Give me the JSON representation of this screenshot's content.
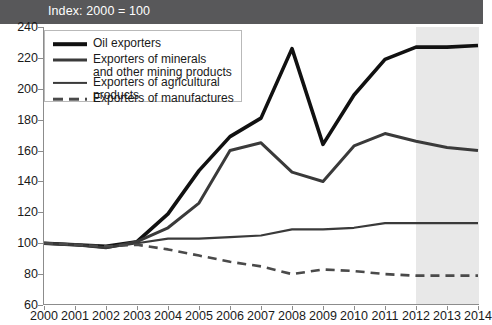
{
  "header": {
    "title": "Index: 2000 = 100",
    "bar_color": "#58585a",
    "text_color": "#ffffff"
  },
  "legend": {
    "items": [
      {
        "label": "Oil exporters",
        "color": "#111111",
        "width": 3.6,
        "dashed": false
      },
      {
        "label": "Exporters of minerals\nand other mining products",
        "color": "#3a3a3a",
        "width": 3.0,
        "dashed": false
      },
      {
        "label": "Exporters of agricultural products",
        "color": "#3a3a3a",
        "width": 2.2,
        "dashed": false
      },
      {
        "label": "Exporters of manufactures",
        "color": "#4a4a4a",
        "width": 2.6,
        "dashed": true
      }
    ]
  },
  "axes": {
    "y_ticks": [
      240,
      220,
      200,
      180,
      160,
      140,
      120,
      100,
      80,
      60
    ],
    "x_ticks": [
      "2000",
      "2001",
      "2002",
      "2003",
      "2004",
      "2005",
      "2006",
      "2007",
      "2008",
      "2009",
      "2010",
      "2011",
      "2012",
      "2013",
      "2014"
    ],
    "axis_color": "#8c8c8c",
    "label_color": "#1a1a1a"
  },
  "forecast": {
    "start_year": "2012",
    "end_year": "2014",
    "shade_color": "#e8e8e8"
  },
  "chart_data": {
    "type": "line",
    "title": "Index: 2000 = 100",
    "xlabel": "",
    "ylabel": "",
    "ylim": [
      60,
      240
    ],
    "xlim": [
      "2000",
      "2014"
    ],
    "grid": false,
    "legend_position": "top-left",
    "x": [
      2000,
      2001,
      2002,
      2003,
      2004,
      2005,
      2006,
      2007,
      2008,
      2009,
      2010,
      2011,
      2012,
      2013,
      2014
    ],
    "categories": [
      "2000",
      "2001",
      "2002",
      "2003",
      "2004",
      "2005",
      "2006",
      "2007",
      "2008",
      "2009",
      "2010",
      "2011",
      "2012",
      "2013",
      "2014"
    ],
    "annotations": [
      {
        "text": "shaded area 2012-2014 denotes projections",
        "x_start": 2012,
        "x_end": 2014
      }
    ],
    "series": [
      {
        "name": "Oil exporters",
        "color": "#111111",
        "width": 3.6,
        "dashed": false,
        "values": [
          100,
          99,
          98,
          101,
          119,
          147,
          169,
          181,
          226,
          164,
          196,
          219,
          227,
          227,
          228
        ]
      },
      {
        "name": "Exporters of minerals and other mining products",
        "color": "#3a3a3a",
        "width": 3.0,
        "dashed": false,
        "values": [
          100,
          99,
          97,
          101,
          110,
          126,
          160,
          165,
          146,
          140,
          163,
          171,
          166,
          162,
          160
        ]
      },
      {
        "name": "Exporters of agricultural products",
        "color": "#3a3a3a",
        "width": 2.2,
        "dashed": false,
        "values": [
          100,
          99,
          97,
          100,
          103,
          103,
          104,
          105,
          109,
          109,
          110,
          113,
          113,
          113,
          113
        ]
      },
      {
        "name": "Exporters of manufactures",
        "color": "#4a4a4a",
        "width": 2.6,
        "dashed": true,
        "values": [
          100,
          99,
          98,
          99,
          96,
          92,
          88,
          85,
          80,
          83,
          82,
          80,
          79,
          79,
          79
        ]
      }
    ]
  }
}
